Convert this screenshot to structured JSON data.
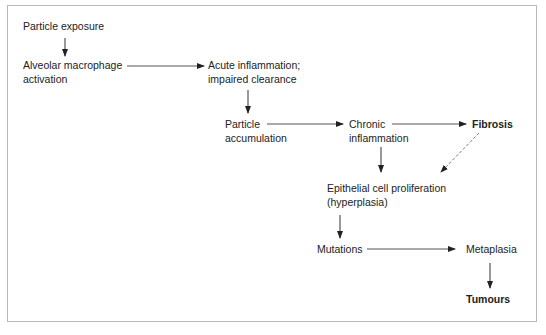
{
  "diagram": {
    "nodes": [
      {
        "id": "particle-exposure",
        "lines": [
          "Particle exposure"
        ],
        "bold": false
      },
      {
        "id": "alveolar-macrophage",
        "lines": [
          "Alveolar macrophage",
          "activation"
        ],
        "bold": false
      },
      {
        "id": "acute-inflammation",
        "lines": [
          "Acute inflammation;",
          "impaired clearance"
        ],
        "bold": false
      },
      {
        "id": "particle-accumulation",
        "lines": [
          "Particle",
          "accumulation"
        ],
        "bold": false
      },
      {
        "id": "chronic-inflammation",
        "lines": [
          "Chronic",
          "inflammation"
        ],
        "bold": false
      },
      {
        "id": "fibrosis",
        "lines": [
          "Fibrosis"
        ],
        "bold": true
      },
      {
        "id": "epithelial-proliferation",
        "lines": [
          "Epithelial cell proliferation",
          "(hyperplasia)"
        ],
        "bold": false
      },
      {
        "id": "mutations",
        "lines": [
          "Mutations"
        ],
        "bold": false
      },
      {
        "id": "metaplasia",
        "lines": [
          "Metaplasia"
        ],
        "bold": false
      },
      {
        "id": "tumours",
        "lines": [
          "Tumours"
        ],
        "bold": true
      }
    ],
    "edges": [
      {
        "from": "particle-exposure",
        "to": "alveolar-macrophage",
        "style": "solid"
      },
      {
        "from": "alveolar-macrophage",
        "to": "acute-inflammation",
        "style": "solid"
      },
      {
        "from": "acute-inflammation",
        "to": "particle-accumulation",
        "style": "solid"
      },
      {
        "from": "particle-accumulation",
        "to": "chronic-inflammation",
        "style": "solid"
      },
      {
        "from": "chronic-inflammation",
        "to": "fibrosis",
        "style": "solid"
      },
      {
        "from": "chronic-inflammation",
        "to": "epithelial-proliferation",
        "style": "solid"
      },
      {
        "from": "fibrosis",
        "to": "epithelial-proliferation",
        "style": "dashed"
      },
      {
        "from": "epithelial-proliferation",
        "to": "mutations",
        "style": "solid"
      },
      {
        "from": "mutations",
        "to": "metaplasia",
        "style": "solid"
      },
      {
        "from": "metaplasia",
        "to": "tumours",
        "style": "solid"
      }
    ]
  },
  "labels": {
    "particle_exposure": "Particle exposure",
    "alveolar_1": "Alveolar macrophage",
    "alveolar_2": "activation",
    "acute_1": "Acute inflammation;",
    "acute_2": "impaired clearance",
    "accum_1": "Particle",
    "accum_2": "accumulation",
    "chronic_1": "Chronic",
    "chronic_2": "inflammation",
    "fibrosis": "Fibrosis",
    "epi_1": "Epithelial cell proliferation",
    "epi_2": "(hyperplasia)",
    "mutations": "Mutations",
    "metaplasia": "Metaplasia",
    "tumours": "Tumours"
  },
  "colors": {
    "border": "#b8b8b8",
    "line": "#333333",
    "dashed_line": "#777777",
    "text": "#222222"
  }
}
